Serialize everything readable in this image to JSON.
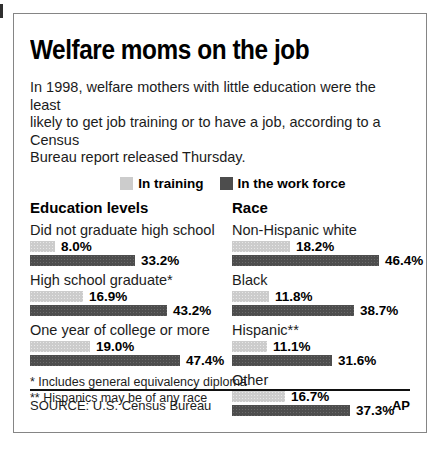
{
  "title": "Welfare moms on the job",
  "intro_lines": [
    "In 1998, welfare mothers with little education were the least",
    "likely to get job training or to have a job, according to a Census",
    "Bureau report released Thursday."
  ],
  "legend": [
    {
      "label": "In training",
      "color": "#cccccc"
    },
    {
      "label": "In the work force",
      "color": "#4d4d4d"
    }
  ],
  "chart_data": {
    "type": "bar",
    "orientation": "horizontal",
    "unit": "%",
    "xlim": [
      0,
      50
    ],
    "grid": false,
    "legend_position": "top",
    "groups": [
      {
        "heading": "Education levels",
        "categories": [
          "Did not graduate high school",
          "High school graduate*",
          "One year of college or more"
        ],
        "series": [
          {
            "name": "In training",
            "values": [
              8.0,
              16.9,
              19.0
            ]
          },
          {
            "name": "In the work force",
            "values": [
              33.2,
              43.2,
              47.4
            ]
          }
        ]
      },
      {
        "heading": "Race",
        "categories": [
          "Non-Hispanic white",
          "Black",
          "Hispanic**",
          "Other"
        ],
        "series": [
          {
            "name": "In training",
            "values": [
              18.2,
              11.8,
              11.1,
              16.7
            ]
          },
          {
            "name": "In the work force",
            "values": [
              46.4,
              38.7,
              31.6,
              37.3
            ]
          }
        ]
      }
    ]
  },
  "footnotes": [
    "* Includes general equivalency diploma",
    "** Hispanics may be of any race"
  ],
  "footer": {
    "source": "SOURCE: U.S. Census Bureau",
    "credit": "AP"
  }
}
